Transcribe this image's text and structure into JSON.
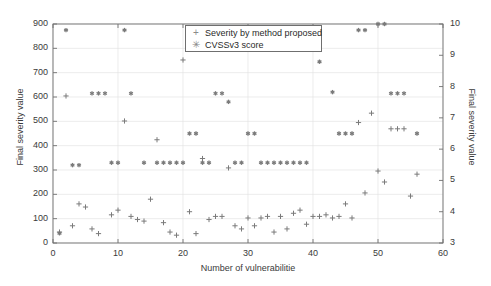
{
  "chart_data": {
    "type": "scatter",
    "title": "",
    "xlabel": "Number of vulnerabilitie",
    "ylabel": "Final severity value",
    "ylabel_right": "Final severity value",
    "xlim": [
      0,
      60
    ],
    "ylim": [
      0,
      900
    ],
    "ylim_right": [
      3,
      10
    ],
    "xticks": [
      0,
      10,
      20,
      30,
      40,
      50,
      60
    ],
    "yticks_left": [
      0,
      100,
      200,
      300,
      400,
      500,
      600,
      700,
      800,
      900
    ],
    "yticks_right": [
      3,
      4,
      5,
      6,
      7,
      8,
      9,
      10
    ],
    "grid": true,
    "legend_position": "top-center",
    "marker_color": "#7a7a7a",
    "axis_color": "#6f6f6f",
    "text_color": "#2a2a2a",
    "series": [
      {
        "name": "Severity by method proposed",
        "marker": "plus",
        "axis": "right",
        "points": [
          [
            1,
            3.35
          ],
          [
            2,
            7.7
          ],
          [
            3,
            3.55
          ],
          [
            4,
            4.25
          ],
          [
            5,
            4.15
          ],
          [
            6,
            3.45
          ],
          [
            7,
            3.3
          ],
          [
            9,
            3.9
          ],
          [
            10,
            4.05
          ],
          [
            11,
            6.9
          ],
          [
            12,
            3.85
          ],
          [
            13,
            3.75
          ],
          [
            14,
            3.7
          ],
          [
            15,
            4.4
          ],
          [
            16,
            6.3
          ],
          [
            17,
            3.65
          ],
          [
            18,
            3.35
          ],
          [
            19,
            3.25
          ],
          [
            20,
            8.85
          ],
          [
            21,
            4.0
          ],
          [
            22,
            3.3
          ],
          [
            23,
            5.7
          ],
          [
            24,
            3.75
          ],
          [
            25,
            3.85
          ],
          [
            26,
            3.85
          ],
          [
            27,
            5.4
          ],
          [
            28,
            3.55
          ],
          [
            29,
            3.45
          ],
          [
            30,
            3.8
          ],
          [
            31,
            3.55
          ],
          [
            32,
            3.8
          ],
          [
            33,
            3.85
          ],
          [
            34,
            3.35
          ],
          [
            35,
            3.85
          ],
          [
            36,
            3.45
          ],
          [
            37,
            3.95
          ],
          [
            38,
            4.05
          ],
          [
            39,
            3.6
          ],
          [
            40,
            3.85
          ],
          [
            41,
            3.85
          ],
          [
            42,
            3.9
          ],
          [
            43,
            3.8
          ],
          [
            44,
            3.85
          ],
          [
            45,
            4.25
          ],
          [
            46,
            3.8
          ],
          [
            47,
            6.85
          ],
          [
            48,
            4.6
          ],
          [
            49,
            7.15
          ],
          [
            50,
            5.3
          ],
          [
            51,
            4.95
          ],
          [
            52,
            6.65
          ],
          [
            53,
            6.65
          ],
          [
            54,
            6.65
          ],
          [
            55,
            4.5
          ],
          [
            56,
            5.2
          ]
        ]
      },
      {
        "name": "CVSSv3 score",
        "marker": "asterisk",
        "axis": "left",
        "points": [
          [
            1,
            40
          ],
          [
            2,
            875
          ],
          [
            3,
            320
          ],
          [
            4,
            320
          ],
          [
            6,
            615
          ],
          [
            7,
            615
          ],
          [
            8,
            615
          ],
          [
            9,
            330
          ],
          [
            10,
            330
          ],
          [
            11,
            875
          ],
          [
            12,
            615
          ],
          [
            14,
            330
          ],
          [
            16,
            330
          ],
          [
            17,
            330
          ],
          [
            18,
            330
          ],
          [
            19,
            330
          ],
          [
            20,
            330
          ],
          [
            21,
            450
          ],
          [
            22,
            450
          ],
          [
            23,
            330
          ],
          [
            24,
            330
          ],
          [
            25,
            615
          ],
          [
            26,
            615
          ],
          [
            27,
            580
          ],
          [
            28,
            330
          ],
          [
            29,
            330
          ],
          [
            30,
            450
          ],
          [
            31,
            450
          ],
          [
            32,
            330
          ],
          [
            33,
            330
          ],
          [
            34,
            330
          ],
          [
            35,
            330
          ],
          [
            36,
            330
          ],
          [
            37,
            330
          ],
          [
            38,
            330
          ],
          [
            39,
            330
          ],
          [
            41,
            745
          ],
          [
            43,
            620
          ],
          [
            44,
            450
          ],
          [
            45,
            450
          ],
          [
            46,
            450
          ],
          [
            47,
            875
          ],
          [
            48,
            875
          ],
          [
            50,
            900
          ],
          [
            51,
            900
          ],
          [
            52,
            615
          ],
          [
            53,
            615
          ],
          [
            54,
            615
          ],
          [
            56,
            450
          ]
        ]
      }
    ]
  },
  "legend": {
    "items": [
      {
        "glyph": "+",
        "label": "Severity by method proposed"
      },
      {
        "glyph": "✳",
        "label": "CVSSv3 score"
      }
    ]
  },
  "axes": {
    "x_label": "Number of vulnerabilitie",
    "y_left_label": "Final severity value",
    "y_right_label": "Final severity value",
    "x_ticks": [
      "0",
      "10",
      "20",
      "30",
      "40",
      "50",
      "60"
    ],
    "y_left_ticks": [
      "900",
      "800",
      "700",
      "600",
      "500",
      "400",
      "300",
      "200",
      "100",
      "0"
    ],
    "y_right_ticks": [
      "10",
      "9",
      "8",
      "7",
      "6",
      "5",
      "4",
      "3"
    ]
  }
}
